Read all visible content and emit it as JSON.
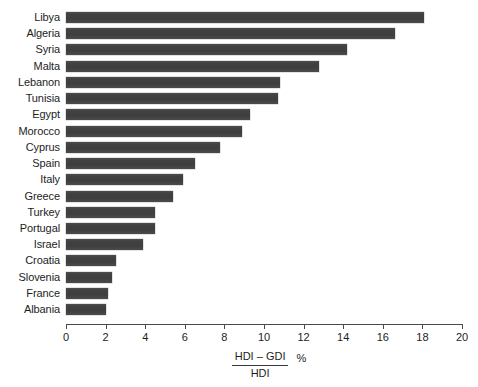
{
  "chart_data": {
    "type": "bar",
    "orientation": "horizontal",
    "title": "",
    "subtitle": "",
    "xlabel_numerator": "HDI – GDI",
    "xlabel_denominator": "HDI",
    "xlabel_unit": "%",
    "ylabel": "",
    "xlim": [
      0,
      20
    ],
    "xticks": [
      0,
      2,
      4,
      6,
      8,
      10,
      12,
      14,
      16,
      18,
      20
    ],
    "xtick_labels": [
      "0",
      "2",
      "4",
      "6",
      "8",
      "10",
      "12",
      "14",
      "16",
      "18",
      "20"
    ],
    "grid": false,
    "legend": false,
    "bar_color": "#414141",
    "categories": [
      "Libya",
      "Algeria",
      "Syria",
      "Malta",
      "Lebanon",
      "Tunisia",
      "Egypt",
      "Morocco",
      "Cyprus",
      "Spain",
      "Italy",
      "Greece",
      "Turkey",
      "Portugal",
      "Israel",
      "Croatia",
      "Slovenia",
      "France",
      "Albania"
    ],
    "values": [
      18.1,
      16.6,
      14.2,
      12.8,
      10.8,
      10.7,
      9.3,
      8.9,
      7.8,
      6.5,
      5.9,
      5.4,
      4.5,
      4.5,
      3.9,
      2.5,
      2.3,
      2.1,
      2.0
    ]
  }
}
